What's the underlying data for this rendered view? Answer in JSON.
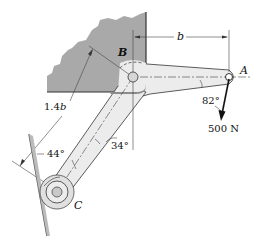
{
  "diagram": {
    "type": "statics-bell-crank",
    "points": {
      "A": {
        "label": "A",
        "x": 229,
        "y": 77
      },
      "B": {
        "label": "B",
        "x": 133,
        "y": 77
      },
      "C": {
        "label": "C",
        "x": 57,
        "y": 192
      }
    },
    "labels": {
      "point_a": "A",
      "point_b": "B",
      "point_c": "C",
      "dim_b": "b",
      "dim_14b_num": "1.4",
      "dim_14b_var": "b",
      "angle_82": "82°",
      "angle_34": "34°",
      "angle_44": "44°",
      "force": "500 N"
    },
    "colors": {
      "support_fill": "#a9a9a9",
      "support_shadow": "#8c8c8c",
      "link_fill": "#ececec",
      "line": "#222222",
      "pin_fill": "#c9c9c9"
    }
  }
}
